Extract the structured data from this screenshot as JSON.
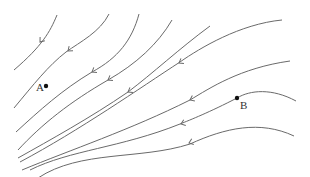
{
  "diagram": {
    "line_color": "#6a6a6a",
    "points": [
      {
        "label": "A",
        "x": 46,
        "y": 86,
        "label_x": 36,
        "label_y": 91
      },
      {
        "label": "B",
        "x": 237,
        "y": 98,
        "label_x": 240,
        "label_y": 109
      }
    ],
    "streamlines": [
      {
        "d": "M57,15 C50,32 42,46 14,70",
        "arrow": {
          "x": 40,
          "y": 42,
          "angle": 128
        }
      },
      {
        "d": "M109,14 C100,32 80,42 66,52 C48,66 34,84 14,108",
        "arrow": {
          "x": 68,
          "y": 51,
          "angle": 140
        }
      },
      {
        "d": "M139,14 C132,40 118,58 92,72 C62,90 40,110 16,132",
        "arrow": {
          "x": 92,
          "y": 72,
          "angle": 148
        }
      },
      {
        "d": "M172,20 C158,44 136,64 108,80 C70,102 42,124 18,150",
        "arrow": {
          "x": 108,
          "y": 80,
          "angle": 150
        }
      },
      {
        "d": "M210,26 C180,48 152,74 128,92 C90,118 50,140 18,158",
        "arrow": {
          "x": 128,
          "y": 92,
          "angle": 150
        }
      },
      {
        "d": "M282,20 C240,24 200,48 180,62 C140,88 80,130 20,162",
        "arrow": {
          "x": 179,
          "y": 63,
          "angle": 150
        }
      },
      {
        "d": "M290,61 C240,68 210,88 190,100 C130,130 70,150 22,170",
        "arrow": {
          "x": 190,
          "y": 100,
          "angle": 155
        }
      },
      {
        "d": "M296,101 C272,88 250,90 237,98 C210,112 190,120 180,124 C120,148 70,150 30,170",
        "arrow": {
          "x": 181,
          "y": 124,
          "angle": 160
        }
      },
      {
        "d": "M294,136 C260,120 225,128 190,144 C140,160 80,150 38,178",
        "arrow": {
          "x": 189,
          "y": 143,
          "angle": 160
        }
      }
    ]
  }
}
